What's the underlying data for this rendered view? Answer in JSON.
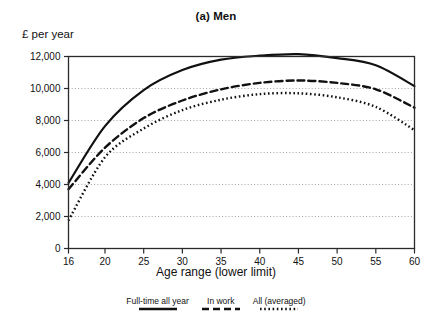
{
  "chart_data": {
    "type": "line",
    "title": "(a) Men",
    "xlabel": "Age range (lower limit)",
    "ylabel": "£ per year",
    "xlim": [
      16,
      60
    ],
    "ylim": [
      0,
      12000
    ],
    "grid": true,
    "legend_position": "bottom",
    "xticks": [
      16,
      20,
      25,
      30,
      35,
      40,
      45,
      50,
      55,
      60
    ],
    "xtick_labels": [
      "16",
      "20",
      "25",
      "30",
      "35",
      "40",
      "45",
      "50",
      "55",
      "60"
    ],
    "yticks": [
      0,
      2000,
      4000,
      6000,
      8000,
      10000,
      12000
    ],
    "ytick_labels": [
      "0",
      "2,000",
      "4,000",
      "6,000",
      "8,000",
      "10,000",
      "12,000"
    ],
    "x": [
      16,
      20,
      25,
      30,
      35,
      40,
      45,
      50,
      55,
      60
    ],
    "series": [
      {
        "name": "Full-time all year",
        "style": "solid",
        "color": "#111111",
        "values": [
          4100,
          7650,
          9900,
          11150,
          11800,
          12050,
          12150,
          11900,
          11450,
          10150
        ]
      },
      {
        "name": "In work",
        "style": "dashed",
        "color": "#111111",
        "values": [
          3700,
          6300,
          8150,
          9250,
          9950,
          10350,
          10500,
          10350,
          9950,
          8800
        ]
      },
      {
        "name": "All (averaged)",
        "style": "dotted",
        "color": "#111111",
        "values": [
          1750,
          5700,
          7500,
          8650,
          9300,
          9650,
          9700,
          9450,
          8850,
          7400
        ]
      }
    ]
  },
  "legend": {
    "items": [
      {
        "label": "Full-time all year",
        "style": "solid"
      },
      {
        "label": "In work",
        "style": "dashed"
      },
      {
        "label": "All (averaged)",
        "style": "dotted"
      }
    ]
  },
  "colors": {
    "ink": "#111111",
    "grid": "#9a9a9a",
    "frame": "#2a2a2a",
    "background": "#ffffff"
  }
}
